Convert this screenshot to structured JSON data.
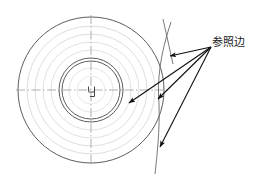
{
  "figure": {
    "type": "engineering-drawing",
    "background_color": "#ffffff",
    "line_color": "#4a4a4a",
    "faint_line_color": "#c8c8c8",
    "arrow_color": "#101010",
    "centerline_color": "#9a9a9a",
    "label": {
      "text": "参照边",
      "x": 212,
      "y": 36,
      "font_size": 11,
      "color": "#1a1a1a"
    },
    "center": {
      "x": 91,
      "y": 90
    },
    "circles": [
      {
        "name": "outer-circle",
        "r": 73,
        "weight": "solid",
        "color": "#4a4a4a"
      },
      {
        "name": "faint-circle-1",
        "r": 64,
        "weight": "faint",
        "color": "#cfcfcf"
      },
      {
        "name": "faint-circle-2",
        "r": 56,
        "weight": "faint",
        "color": "#cfcfcf"
      },
      {
        "name": "faint-circle-3",
        "r": 48,
        "weight": "faint",
        "color": "#cfcfcf"
      },
      {
        "name": "faint-circle-4",
        "r": 40,
        "weight": "faint",
        "color": "#cfcfcf"
      },
      {
        "name": "inner-circle-outer",
        "r": 32,
        "weight": "solid",
        "color": "#4a4a4a"
      },
      {
        "name": "inner-circle-inner",
        "r": 29,
        "weight": "solid",
        "color": "#4a4a4a"
      },
      {
        "name": "faint-circle-5",
        "r": 22,
        "weight": "faint",
        "color": "#d5d5d5"
      },
      {
        "name": "faint-circle-6",
        "r": 14,
        "weight": "faint",
        "color": "#dcdcdc"
      }
    ],
    "centerlines": [
      {
        "name": "horizontal-centerline",
        "x1": 16,
        "y1": 90,
        "x2": 168,
        "y2": 90
      },
      {
        "name": "vertical-centerline",
        "x1": 91,
        "y1": 15,
        "x2": 91,
        "y2": 166
      }
    ],
    "center_mark": {
      "name": "center-keyway-mark",
      "description": "small step/notch detail at the disc center"
    },
    "reference_arc": {
      "name": "reference-edge-arc",
      "description": "large-radius arc sweeping down the right side of the disc",
      "top": {
        "x": 171,
        "y": 22
      },
      "bulge": {
        "x": 160,
        "y": 96
      },
      "bottom": {
        "x": 155,
        "y": 172
      }
    },
    "upper_line": {
      "name": "upper-reference-line",
      "x1": 163,
      "y1": 20,
      "x2": 172,
      "y2": 62
    },
    "leader_origin": {
      "x": 211,
      "y": 47
    },
    "arrows": [
      {
        "name": "leader-arrow-1",
        "tip_x": 168,
        "tip_y": 57,
        "target": "upper-reference-line"
      },
      {
        "name": "leader-arrow-2",
        "tip_x": 126,
        "tip_y": 104,
        "target": "inner-region"
      },
      {
        "name": "leader-arrow-3",
        "tip_x": 156,
        "tip_y": 100,
        "target": "reference-edge-arc"
      },
      {
        "name": "leader-arrow-4",
        "tip_x": 158,
        "tip_y": 148,
        "target": "reference-edge-arc-lower"
      }
    ]
  }
}
